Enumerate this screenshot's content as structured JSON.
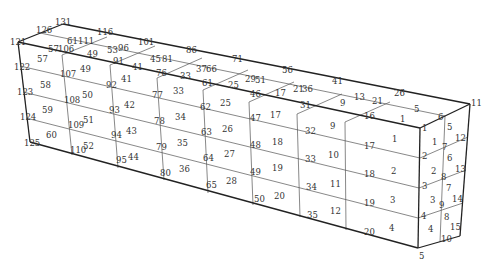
{
  "diagram": {
    "type": "finite-element-mesh",
    "colors": {
      "line": "#222222",
      "grid": "#555555",
      "text": "#333333",
      "background": "#ffffff"
    },
    "outline": [
      [
        [
          18,
          42
        ],
        [
          63,
          24
        ]
      ],
      [
        [
          63,
          24
        ],
        [
          470,
          104
        ]
      ],
      [
        [
          18,
          42
        ],
        [
          420,
          128
        ]
      ],
      [
        [
          420,
          128
        ],
        [
          470,
          104
        ]
      ],
      [
        [
          18,
          42
        ],
        [
          30,
          142
        ]
      ],
      [
        [
          30,
          142
        ],
        [
          418,
          248
        ]
      ],
      [
        [
          420,
          128
        ],
        [
          418,
          248
        ]
      ],
      [
        [
          470,
          104
        ],
        [
          460,
          236
        ]
      ],
      [
        [
          418,
          248
        ],
        [
          460,
          236
        ]
      ]
    ],
    "grid_lines": [
      [
        [
          62,
          55
        ],
        [
          107,
          37
        ]
      ],
      [
        [
          110,
          65
        ],
        [
          155,
          46
        ]
      ],
      [
        [
          157,
          78
        ],
        [
          202,
          58
        ]
      ],
      [
        [
          203,
          90
        ],
        [
          248,
          70
        ]
      ],
      [
        [
          249,
          102
        ],
        [
          294,
          82
        ]
      ],
      [
        [
          297,
          114
        ],
        [
          342,
          94
        ]
      ],
      [
        [
          345,
          122
        ],
        [
          390,
          102
        ]
      ],
      [
        [
          40,
          33
        ],
        [
          445,
          116
        ]
      ],
      [
        [
          62,
          55
        ],
        [
          72,
          155
        ]
      ],
      [
        [
          110,
          65
        ],
        [
          118,
          168
        ]
      ],
      [
        [
          157,
          78
        ],
        [
          164,
          180
        ]
      ],
      [
        [
          203,
          90
        ],
        [
          208,
          193
        ]
      ],
      [
        [
          249,
          102
        ],
        [
          253,
          205
        ]
      ],
      [
        [
          297,
          114
        ],
        [
          300,
          217
        ]
      ],
      [
        [
          345,
          122
        ],
        [
          346,
          230
        ]
      ],
      [
        [
          20,
          66
        ],
        [
          420,
          158
        ]
      ],
      [
        [
          23,
          92
        ],
        [
          419,
          188
        ]
      ],
      [
        [
          26,
          118
        ],
        [
          418,
          218
        ]
      ],
      [
        [
          445,
          116
        ],
        [
          440,
          242
        ]
      ],
      [
        [
          420,
          158
        ],
        [
          468,
          137
        ]
      ],
      [
        [
          419,
          188
        ],
        [
          466,
          170
        ]
      ],
      [
        [
          418,
          218
        ],
        [
          463,
          203
        ]
      ]
    ],
    "nodes": [
      {
        "id": "131",
        "x": 55,
        "y": 25
      },
      {
        "id": "126",
        "x": 36,
        "y": 33
      },
      {
        "id": "121",
        "x": 10,
        "y": 45
      },
      {
        "id": "116",
        "x": 97,
        "y": 35
      },
      {
        "id": "111",
        "x": 78,
        "y": 44
      },
      {
        "id": "106",
        "x": 58,
        "y": 52
      },
      {
        "id": "101",
        "x": 138,
        "y": 45
      },
      {
        "id": "96",
        "x": 118,
        "y": 51
      },
      {
        "id": "91",
        "x": 113,
        "y": 64
      },
      {
        "id": "86",
        "x": 186,
        "y": 53
      },
      {
        "id": "81",
        "x": 162,
        "y": 62
      },
      {
        "id": "76",
        "x": 156,
        "y": 76
      },
      {
        "id": "71",
        "x": 232,
        "y": 62
      },
      {
        "id": "66",
        "x": 206,
        "y": 72
      },
      {
        "id": "61",
        "x": 202,
        "y": 86
      },
      {
        "id": "56",
        "x": 282,
        "y": 73
      },
      {
        "id": "51",
        "x": 255,
        "y": 83
      },
      {
        "id": "46",
        "x": 250,
        "y": 97
      },
      {
        "id": "41",
        "x": 332,
        "y": 84
      },
      {
        "id": "36",
        "x": 302,
        "y": 92
      },
      {
        "id": "31",
        "x": 300,
        "y": 108
      },
      {
        "id": "26",
        "x": 394,
        "y": 96
      },
      {
        "id": "21",
        "x": 372,
        "y": 104
      },
      {
        "id": "16",
        "x": 364,
        "y": 119
      },
      {
        "id": "11",
        "x": 471,
        "y": 106
      },
      {
        "id": "6",
        "x": 438,
        "y": 120
      },
      {
        "id": "1",
        "x": 422,
        "y": 131
      },
      {
        "id": "122",
        "x": 14,
        "y": 70
      },
      {
        "id": "123",
        "x": 17,
        "y": 95
      },
      {
        "id": "124",
        "x": 20,
        "y": 120
      },
      {
        "id": "125",
        "x": 24,
        "y": 146
      },
      {
        "id": "107",
        "x": 60,
        "y": 77
      },
      {
        "id": "108",
        "x": 64,
        "y": 103
      },
      {
        "id": "109",
        "x": 68,
        "y": 128
      },
      {
        "id": "110",
        "x": 70,
        "y": 153
      },
      {
        "id": "92",
        "x": 106,
        "y": 88
      },
      {
        "id": "93",
        "x": 109,
        "y": 113
      },
      {
        "id": "94",
        "x": 111,
        "y": 138
      },
      {
        "id": "95",
        "x": 116,
        "y": 163
      },
      {
        "id": "77",
        "x": 152,
        "y": 98
      },
      {
        "id": "78",
        "x": 154,
        "y": 124
      },
      {
        "id": "79",
        "x": 156,
        "y": 150
      },
      {
        "id": "80",
        "x": 160,
        "y": 176
      },
      {
        "id": "62",
        "x": 200,
        "y": 110
      },
      {
        "id": "63",
        "x": 201,
        "y": 135
      },
      {
        "id": "64",
        "x": 203,
        "y": 161
      },
      {
        "id": "65",
        "x": 206,
        "y": 188
      },
      {
        "id": "47",
        "x": 250,
        "y": 121
      },
      {
        "id": "48",
        "x": 250,
        "y": 148
      },
      {
        "id": "49",
        "x": 250,
        "y": 175
      },
      {
        "id": "50",
        "x": 254,
        "y": 202
      },
      {
        "id": "32",
        "x": 305,
        "y": 134
      },
      {
        "id": "33",
        "x": 305,
        "y": 162
      },
      {
        "id": "34",
        "x": 306,
        "y": 190
      },
      {
        "id": "35",
        "x": 307,
        "y": 218
      },
      {
        "id": "17",
        "x": 364,
        "y": 149
      },
      {
        "id": "18",
        "x": 364,
        "y": 177
      },
      {
        "id": "19",
        "x": 364,
        "y": 206
      },
      {
        "id": "20",
        "x": 364,
        "y": 235
      },
      {
        "id": "2",
        "x": 422,
        "y": 159
      },
      {
        "id": "3",
        "x": 422,
        "y": 189
      },
      {
        "id": "4",
        "x": 421,
        "y": 219
      },
      {
        "id": "5",
        "x": 419,
        "y": 259
      },
      {
        "id": "7",
        "x": 442,
        "y": 150
      },
      {
        "id": "8",
        "x": 441,
        "y": 180
      },
      {
        "id": "9",
        "x": 439,
        "y": 208
      },
      {
        "id": "10",
        "x": 441,
        "y": 242
      },
      {
        "id": "12",
        "x": 455,
        "y": 141
      },
      {
        "id": "13",
        "x": 455,
        "y": 172
      },
      {
        "id": "14",
        "x": 452,
        "y": 202
      },
      {
        "id": "15",
        "x": 450,
        "y": 230
      }
    ],
    "elements": [
      {
        "id": "61",
        "x": 67,
        "y": 44
      },
      {
        "id": "57",
        "x": 48,
        "y": 52
      },
      {
        "id": "53",
        "x": 107,
        "y": 53
      },
      {
        "id": "49",
        "x": 87,
        "y": 57
      },
      {
        "id": "45",
        "x": 150,
        "y": 62
      },
      {
        "id": "41",
        "x": 132,
        "y": 70
      },
      {
        "id": "37",
        "x": 196,
        "y": 72
      },
      {
        "id": "33",
        "x": 180,
        "y": 79
      },
      {
        "id": "29",
        "x": 245,
        "y": 82
      },
      {
        "id": "25",
        "x": 228,
        "y": 88
      },
      {
        "id": "21",
        "x": 293,
        "y": 92
      },
      {
        "id": "17",
        "x": 275,
        "y": 96
      },
      {
        "id": "13",
        "x": 354,
        "y": 100
      },
      {
        "id": "9",
        "x": 340,
        "y": 106
      },
      {
        "id": "5",
        "x": 414,
        "y": 112
      },
      {
        "id": "1",
        "x": 400,
        "y": 122
      },
      {
        "id": "57",
        "x": 37,
        "y": 62
      },
      {
        "id": "58",
        "x": 40,
        "y": 88
      },
      {
        "id": "59",
        "x": 42,
        "y": 113
      },
      {
        "id": "60",
        "x": 46,
        "y": 138
      },
      {
        "id": "49",
        "x": 80,
        "y": 72
      },
      {
        "id": "50",
        "x": 82,
        "y": 98
      },
      {
        "id": "51",
        "x": 83,
        "y": 123
      },
      {
        "id": "52",
        "x": 83,
        "y": 149
      },
      {
        "id": "41",
        "x": 121,
        "y": 82
      },
      {
        "id": "42",
        "x": 124,
        "y": 108
      },
      {
        "id": "43",
        "x": 126,
        "y": 134
      },
      {
        "id": "44",
        "x": 128,
        "y": 160
      },
      {
        "id": "33",
        "x": 173,
        "y": 94
      },
      {
        "id": "34",
        "x": 175,
        "y": 120
      },
      {
        "id": "35",
        "x": 177,
        "y": 146
      },
      {
        "id": "36",
        "x": 179,
        "y": 172
      },
      {
        "id": "25",
        "x": 220,
        "y": 106
      },
      {
        "id": "26",
        "x": 222,
        "y": 132
      },
      {
        "id": "27",
        "x": 224,
        "y": 157
      },
      {
        "id": "28",
        "x": 226,
        "y": 184
      },
      {
        "id": "17",
        "x": 270,
        "y": 118
      },
      {
        "id": "18",
        "x": 272,
        "y": 145
      },
      {
        "id": "19",
        "x": 272,
        "y": 171
      },
      {
        "id": "20",
        "x": 274,
        "y": 199
      },
      {
        "id": "9",
        "x": 330,
        "y": 129
      },
      {
        "id": "10",
        "x": 328,
        "y": 158
      },
      {
        "id": "11",
        "x": 330,
        "y": 187
      },
      {
        "id": "12",
        "x": 330,
        "y": 214
      },
      {
        "id": "1",
        "x": 392,
        "y": 142
      },
      {
        "id": "2",
        "x": 391,
        "y": 174
      },
      {
        "id": "3",
        "x": 390,
        "y": 203
      },
      {
        "id": "4",
        "x": 389,
        "y": 231
      },
      {
        "id": "1",
        "x": 432,
        "y": 145
      },
      {
        "id": "2",
        "x": 431,
        "y": 174
      },
      {
        "id": "3",
        "x": 430,
        "y": 203
      },
      {
        "id": "4",
        "x": 428,
        "y": 232
      },
      {
        "id": "5",
        "x": 447,
        "y": 130
      },
      {
        "id": "6",
        "x": 447,
        "y": 161
      },
      {
        "id": "7",
        "x": 446,
        "y": 191
      },
      {
        "id": "8",
        "x": 444,
        "y": 220
      }
    ]
  }
}
